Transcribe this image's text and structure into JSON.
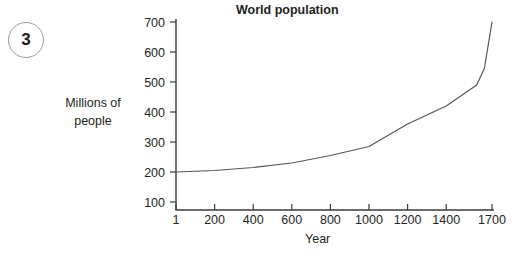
{
  "question_number": "3",
  "chart_data": {
    "type": "line",
    "title": "World population",
    "xlabel": "Year",
    "ylabel": "Millions of people",
    "ylabel_lines": [
      "Millions of",
      "people"
    ],
    "xticks": [
      1,
      200,
      400,
      600,
      800,
      1000,
      1200,
      1400,
      1700
    ],
    "xtick_labels": [
      "1",
      "200",
      "400",
      "600",
      "800",
      "1000",
      "1200",
      "1400",
      "1700"
    ],
    "yticks": [
      100,
      200,
      300,
      400,
      500,
      600,
      700
    ],
    "ytick_labels": [
      "100",
      "200",
      "300",
      "400",
      "500",
      "600",
      "700"
    ],
    "xlim": [
      1,
      1700
    ],
    "ylim": [
      100,
      700
    ],
    "grid": false,
    "legend": null,
    "series": [
      {
        "name": "World population",
        "x": [
          1,
          200,
          400,
          600,
          800,
          1000,
          1200,
          1400,
          1600,
          1650,
          1700
        ],
        "values": [
          200,
          205,
          215,
          230,
          255,
          285,
          360,
          420,
          490,
          545,
          700
        ]
      }
    ],
    "line_color": "#555555",
    "axis_color": "#3b3b3b"
  }
}
